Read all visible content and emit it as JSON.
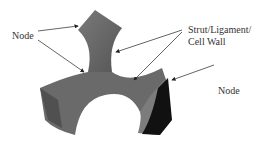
{
  "labels": {
    "node_top": "Node",
    "strut_line1": "Strut/Ligament/",
    "strut_line2": "Cell Wall",
    "node_right": "Node"
  },
  "colors": {
    "solid_mid": "#6e6e6e",
    "solid_dark": "#4a4a4a",
    "solid_black": "#111111",
    "arrow": "#222222"
  }
}
